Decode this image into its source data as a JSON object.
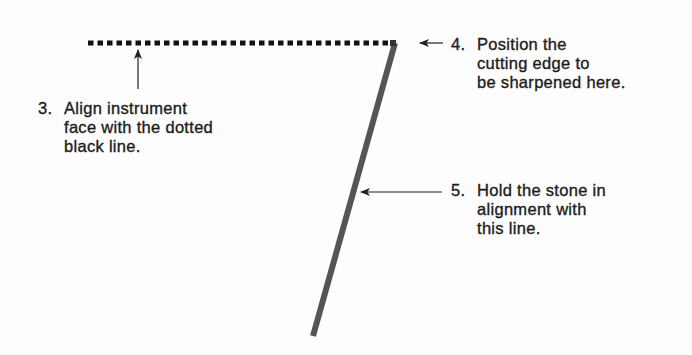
{
  "diagram": {
    "title": "",
    "colors": {
      "background": "#fdfdfd",
      "text": "#1c1c1c",
      "dotted_line": "#111111",
      "stone_line": "#555555",
      "arrows": "#222222"
    },
    "steps": [
      {
        "number": "3.",
        "lines": [
          "Align instrument",
          "face with the dotted",
          "black line."
        ]
      },
      {
        "number": "4.",
        "lines": [
          "Position the",
          "cutting edge to",
          "be sharpened here."
        ]
      },
      {
        "number": "5.",
        "lines": [
          "Hold the stone in",
          "alignment with",
          "this line."
        ]
      }
    ],
    "elements": {
      "dotted_line": {
        "x1": 88,
        "x2": 394,
        "y": 43,
        "description": "instrument face reference line"
      },
      "stone_line": {
        "x1": 395,
        "y1": 43,
        "x2": 313,
        "y2": 336,
        "description": "sharpening stone alignment line"
      },
      "cutting_edge_point": {
        "x": 394,
        "y": 43
      }
    }
  }
}
